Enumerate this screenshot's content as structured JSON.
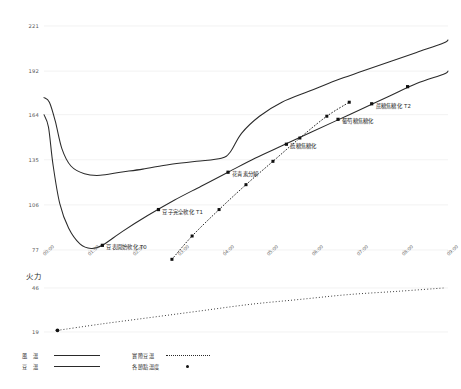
{
  "chart_data": {
    "type": "line",
    "title": "",
    "xlabel": "",
    "ylabel": "",
    "ylim": [
      77,
      221
    ],
    "grid": true,
    "legend_position": "bottom-left",
    "yticks": [
      "221",
      "192",
      "164",
      "135",
      "106",
      "77"
    ],
    "ytick_values": [
      221,
      192,
      164,
      135,
      106,
      77
    ],
    "xticks": [
      "00:00",
      "01:00",
      "02:00",
      "03:00",
      "04:00",
      "05:00",
      "06:00",
      "07:00",
      "08:00",
      "09:00"
    ],
    "series": [
      {
        "name": "風溫",
        "style": "solid",
        "x": [
          0.0,
          0.12,
          0.25,
          0.4,
          0.6,
          0.9,
          1.25,
          1.7,
          2.2,
          2.8,
          3.4,
          3.95,
          4.15,
          4.4,
          4.8,
          5.3,
          5.9,
          6.5,
          7.1,
          7.7,
          8.3,
          8.9,
          9.0
        ],
        "values": [
          175,
          172,
          160,
          142,
          131,
          126,
          125,
          127,
          129,
          132,
          134,
          136,
          140,
          152,
          163,
          172,
          179,
          186,
          192,
          198,
          204,
          210,
          212
        ]
      },
      {
        "name": "豆溫",
        "style": "solid",
        "x": [
          0.0,
          0.1,
          0.2,
          0.35,
          0.55,
          0.8,
          1.05,
          1.3,
          1.75,
          2.3,
          2.9,
          3.5,
          4.1,
          4.7,
          5.3,
          5.9,
          6.5,
          7.1,
          7.7,
          8.3,
          8.9,
          9.0
        ],
        "values": [
          164,
          156,
          132,
          107,
          91,
          81,
          78,
          80,
          89,
          99,
          109,
          118,
          127,
          136,
          144,
          152,
          160,
          168,
          176,
          184,
          190,
          192
        ]
      },
      {
        "name": "實際豆溫",
        "style": "dotted",
        "x": [
          2.85,
          3.3,
          3.9,
          4.5,
          5.1,
          5.7,
          6.3,
          6.8
        ],
        "values": [
          71,
          86,
          103,
          119,
          134,
          149,
          163,
          172
        ]
      }
    ],
    "node_points": {
      "name": "各節點溫度",
      "points": [
        {
          "label": "豆表開始軟化 T0",
          "x": 1.3,
          "y": 80,
          "series": "豆溫"
        },
        {
          "label": "豆子完全軟化 T1",
          "x": 2.55,
          "y": 103,
          "series": "豆溫"
        },
        {
          "label": "花青素分解",
          "x": 4.1,
          "y": 127,
          "series": "豆溫"
        },
        {
          "label": "蔬糖焦糖化",
          "x": 5.4,
          "y": 145,
          "series": "豆溫"
        },
        {
          "label": "葡萄糖焦糖化",
          "x": 6.55,
          "y": 161,
          "series": "豆溫"
        },
        {
          "label": "蔗糖焦糖化 T2",
          "x": 7.3,
          "y": 171,
          "series": "豆溫"
        },
        {
          "label": "",
          "x": 8.1,
          "y": 182,
          "series": "豆溫"
        }
      ]
    },
    "fire_panel": {
      "title": "火力",
      "yticks": [
        "46",
        "19"
      ],
      "ylim": [
        19,
        46
      ],
      "x": [
        0.3,
        1.3,
        2.4,
        3.5,
        4.6,
        5.7,
        6.8,
        7.9,
        8.9
      ],
      "values": [
        20,
        24,
        28,
        32,
        36,
        39,
        42,
        44,
        46
      ],
      "marker_x": [
        0.3
      ],
      "style": "dotted"
    }
  },
  "legend": {
    "entries": [
      {
        "label": "風　溫",
        "marker": "solid-line"
      },
      {
        "label": "豆　溫",
        "marker": "solid-line"
      },
      {
        "label": "實際豆溫",
        "marker": "dotted-line"
      },
      {
        "label": "各節點溫度",
        "marker": "dot"
      }
    ]
  },
  "colors": {
    "line": "#2a2a2a",
    "grid": "#ececec",
    "text": "#3a3a3a",
    "tick": "#666666",
    "background": "#ffffff"
  }
}
